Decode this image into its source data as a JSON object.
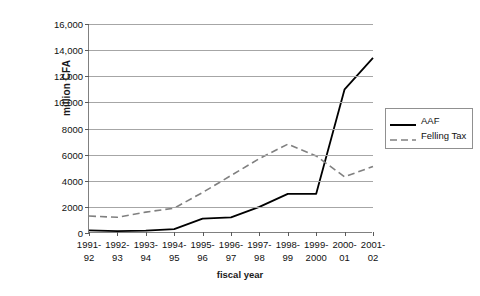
{
  "chart_data": {
    "type": "line",
    "title": "",
    "xlabel": "fiscal year",
    "ylabel": "million CFA",
    "categories": [
      "1991-\n92",
      "1992-\n93",
      "1993-\n94",
      "1994-\n95",
      "1995-\n96",
      "1996-\n97",
      "1997-\n98",
      "1998-\n99",
      "1999-\n2000",
      "2000-\n01",
      "2001-\n02"
    ],
    "category_lines": [
      [
        "1991-",
        "92"
      ],
      [
        "1992-",
        "93"
      ],
      [
        "1993-",
        "94"
      ],
      [
        "1994-",
        "95"
      ],
      [
        "1995-",
        "96"
      ],
      [
        "1996-",
        "97"
      ],
      [
        "1997-",
        "98"
      ],
      [
        "1998-",
        "99"
      ],
      [
        "1999-",
        "2000"
      ],
      [
        "2000-",
        "01"
      ],
      [
        "2001-",
        "02"
      ]
    ],
    "series": [
      {
        "name": "AAF",
        "style": "solid",
        "color": "#000000",
        "values": [
          200,
          150,
          180,
          300,
          1100,
          1200,
          2000,
          3000,
          3000,
          11000,
          13400
        ]
      },
      {
        "name": "Felling Tax",
        "style": "dashed",
        "color": "#808080",
        "values": [
          1300,
          1200,
          1600,
          1900,
          3100,
          4400,
          5700,
          6800,
          5900,
          4300,
          5100
        ]
      }
    ],
    "ylim": [
      0,
      16000
    ],
    "ytick_values": [
      0,
      2000,
      4000,
      6000,
      8000,
      10000,
      12000,
      14000,
      16000
    ],
    "ytick_labels": [
      "0",
      "2000",
      "4000",
      "6000",
      "8000",
      "10,000",
      "12,000",
      "14,000",
      "16,000"
    ],
    "grid": true,
    "grid_color": "#a6a6a6",
    "legend_position": "right",
    "axis_color": "#808080",
    "background": "#ffffff"
  },
  "legend": {
    "items": [
      {
        "label": "AAF"
      },
      {
        "label": "Felling Tax"
      }
    ]
  }
}
